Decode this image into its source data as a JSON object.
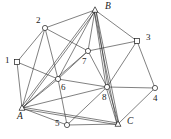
{
  "figure": {
    "name": "graph-diagram",
    "background_color": "#ffffff",
    "stroke_color": "#2b2b2b",
    "label_color": "#1a1a1a",
    "width": 171,
    "height": 139
  },
  "nodes": [
    {
      "id": "1",
      "label": "1",
      "shape": "square",
      "x": 17,
      "y": 62,
      "label_x": 5,
      "label_y": 56,
      "italic": false
    },
    {
      "id": "2",
      "label": "2",
      "shape": "circle",
      "x": 45,
      "y": 28,
      "label_x": 36,
      "label_y": 16,
      "italic": false
    },
    {
      "id": "3",
      "label": "3",
      "shape": "square",
      "x": 137,
      "y": 41,
      "label_x": 146,
      "label_y": 33,
      "italic": false
    },
    {
      "id": "4",
      "label": "4",
      "shape": "circle",
      "x": 155,
      "y": 88,
      "label_x": 153,
      "label_y": 94,
      "italic": false
    },
    {
      "id": "5",
      "label": "5",
      "shape": "circle",
      "x": 67,
      "y": 125,
      "label_x": 55,
      "label_y": 119,
      "italic": false
    },
    {
      "id": "6",
      "label": "6",
      "shape": "circle",
      "x": 58,
      "y": 79,
      "label_x": 61,
      "label_y": 83,
      "italic": false
    },
    {
      "id": "7",
      "label": "7",
      "shape": "circle",
      "x": 88,
      "y": 51,
      "label_x": 82,
      "label_y": 57,
      "italic": false
    },
    {
      "id": "8",
      "label": "8",
      "shape": "circle",
      "x": 107,
      "y": 87,
      "label_x": 102,
      "label_y": 93,
      "italic": false
    },
    {
      "id": "A",
      "label": "A",
      "shape": "triangle",
      "x": 22,
      "y": 108,
      "label_x": 17,
      "label_y": 112,
      "italic": true
    },
    {
      "id": "B",
      "label": "B",
      "shape": "triangle",
      "x": 95,
      "y": 10,
      "label_x": 105,
      "label_y": 2,
      "italic": true
    },
    {
      "id": "C",
      "label": "C",
      "shape": "triangle",
      "x": 118,
      "y": 124,
      "label_x": 127,
      "label_y": 117,
      "italic": true
    }
  ],
  "edges": [
    {
      "from": "1",
      "to": "2",
      "style": "single"
    },
    {
      "from": "1",
      "to": "A",
      "style": "single"
    },
    {
      "from": "1",
      "to": "6",
      "style": "single"
    },
    {
      "from": "2",
      "to": "B",
      "style": "single"
    },
    {
      "from": "2",
      "to": "A",
      "style": "single"
    },
    {
      "from": "2",
      "to": "6",
      "style": "single"
    },
    {
      "from": "2",
      "to": "7",
      "style": "single"
    },
    {
      "from": "3",
      "to": "B",
      "style": "single"
    },
    {
      "from": "3",
      "to": "4",
      "style": "single"
    },
    {
      "from": "3",
      "to": "8",
      "style": "single"
    },
    {
      "from": "3",
      "to": "7",
      "style": "single"
    },
    {
      "from": "4",
      "to": "C",
      "style": "single"
    },
    {
      "from": "4",
      "to": "8",
      "style": "single"
    },
    {
      "from": "5",
      "to": "A",
      "style": "single"
    },
    {
      "from": "5",
      "to": "C",
      "style": "single"
    },
    {
      "from": "5",
      "to": "6",
      "style": "single"
    },
    {
      "from": "5",
      "to": "8",
      "style": "single"
    },
    {
      "from": "6",
      "to": "7",
      "style": "single"
    },
    {
      "from": "6",
      "to": "8",
      "style": "single"
    },
    {
      "from": "6",
      "to": "B",
      "style": "single"
    },
    {
      "from": "6",
      "to": "A",
      "style": "single"
    },
    {
      "from": "7",
      "to": "B",
      "style": "single"
    },
    {
      "from": "7",
      "to": "8",
      "style": "single"
    },
    {
      "from": "7",
      "to": "A",
      "style": "single"
    },
    {
      "from": "8",
      "to": "B",
      "style": "double"
    },
    {
      "from": "8",
      "to": "C",
      "style": "double"
    },
    {
      "from": "8",
      "to": "A",
      "style": "single"
    },
    {
      "from": "A",
      "to": "B",
      "style": "double"
    },
    {
      "from": "A",
      "to": "C",
      "style": "double"
    },
    {
      "from": "B",
      "to": "C",
      "style": "double"
    }
  ]
}
